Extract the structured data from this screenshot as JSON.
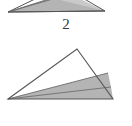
{
  "figure": {
    "background_color": "#ffffff",
    "outline_color": "#555555",
    "shade_color": "#b4b4b4",
    "shade_color_light": "#c9c9c9",
    "caption_color": "#3a3a3a",
    "panels": [
      {
        "id": "top-triangle-figure",
        "caption": "2",
        "description": "partially cropped shaded triangle",
        "clipped": true,
        "outline_points": "8,12 105,11 62,-14",
        "shaded_bands": [
          {
            "name": "upper-band",
            "points": "8,12 105,11 70,-6",
            "fill": "#c9c9c9"
          },
          {
            "name": "lower-band",
            "points": "8,12 105,11 52,-2",
            "fill": "#b4b4b4"
          }
        ]
      },
      {
        "id": "bottom-triangle-figure",
        "caption": "5",
        "description": "triangle divided into three regions by two cevians from the left vertex",
        "clipped": false,
        "vertices": {
          "left": "8,99",
          "apex": "77,49",
          "right": "113,99"
        },
        "outline_points": "8,99 77,49 113,99",
        "regions": [
          {
            "name": "upper-region",
            "points": "8,99 77,49 108,73",
            "fill": "#ffffff"
          },
          {
            "name": "middle-region",
            "points": "8,99 108,73 111,87",
            "fill": "#b4b4b4"
          },
          {
            "name": "lower-region",
            "points": "8,99 111,87 113,99",
            "fill": "#b4b4b4"
          }
        ],
        "divider_lines": [
          {
            "name": "upper-divider",
            "from": "8,99",
            "to": "108,73"
          },
          {
            "name": "lower-divider",
            "from": "8,99",
            "to": "111,87"
          }
        ]
      }
    ]
  },
  "labels": {
    "top_caption": "2",
    "bottom_caption": "5"
  }
}
